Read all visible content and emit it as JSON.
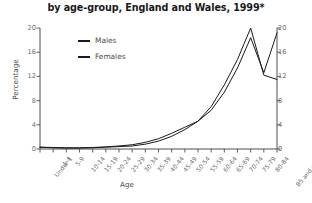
{
  "chart_data": {
    "type": "line",
    "title": "by age-group, England and Wales, 1999*",
    "xlabel": "Age",
    "ylabel": "Percentage",
    "ylim": [
      0,
      20
    ],
    "yticks": [
      0,
      4,
      8,
      12,
      16,
      20
    ],
    "yticks_right": [
      0,
      4,
      8,
      12,
      16,
      20
    ],
    "grid": false,
    "legend_position": "upper-left-inside",
    "dual_axis": true,
    "categories": [
      "Under 1",
      "1-4",
      "5-9",
      "10-14",
      "15-19",
      "20-24",
      "25-29",
      "30-34",
      "35-39",
      "40-44",
      "45-49",
      "50-54",
      "55-59",
      "60-64",
      "65-69",
      "70-74",
      "75-79",
      "80-84",
      "85 and over"
    ],
    "series": [
      {
        "name": "Males",
        "color": "#1a1a1a",
        "values": [
          0.3,
          0.2,
          0.15,
          0.15,
          0.2,
          0.3,
          0.4,
          0.5,
          0.8,
          1.3,
          2.1,
          3.2,
          4.6,
          7.0,
          10.6,
          14.8,
          20.0,
          12.2,
          11.5
        ]
      },
      {
        "name": "Females",
        "color": "#1a1a1a",
        "values": [
          0.3,
          0.25,
          0.2,
          0.2,
          0.25,
          0.35,
          0.5,
          0.7,
          1.1,
          1.7,
          2.6,
          3.6,
          4.6,
          6.4,
          9.4,
          13.4,
          18.4,
          12.6,
          19.2
        ]
      }
    ]
  },
  "legend": {
    "items": [
      {
        "label": "Males"
      },
      {
        "label": "Females"
      }
    ]
  }
}
